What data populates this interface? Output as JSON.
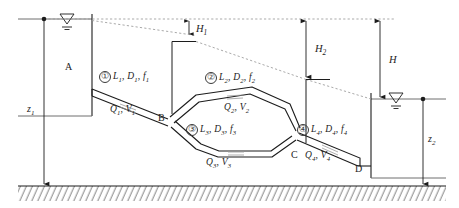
{
  "figure": {
    "type": "engineering-schematic",
    "background_color": "#ffffff",
    "line_color": "#1c1c1c",
    "hgl_color": "#8a8a8a"
  },
  "reservoirs": [
    {
      "id": "A",
      "label": "A",
      "side": "left"
    },
    {
      "id": "D",
      "label": "D",
      "side": "right"
    }
  ],
  "nodes": [
    {
      "id": "B",
      "label": "B"
    },
    {
      "id": "C",
      "label": "C"
    },
    {
      "id": "D",
      "label": "D"
    }
  ],
  "pipes": [
    {
      "number": "①",
      "geometry_label": "L",
      "geometry": {
        "length": "L",
        "diameter": "D",
        "friction": "f",
        "index": "1"
      },
      "flow": {
        "discharge": "Q",
        "velocity": "V",
        "index": "1"
      }
    },
    {
      "number": "②",
      "geometry": {
        "length": "L",
        "diameter": "D",
        "friction": "f",
        "index": "2"
      },
      "flow": {
        "discharge": "Q",
        "velocity": "V",
        "index": "2"
      }
    },
    {
      "number": "③",
      "geometry": {
        "length": "L",
        "diameter": "D",
        "friction": "f",
        "index": "3"
      },
      "flow": {
        "discharge": "Q",
        "velocity": "V",
        "index": "3"
      }
    },
    {
      "number": "④",
      "geometry": {
        "length": "L",
        "diameter": "D",
        "friction": "f",
        "index": "4"
      },
      "flow": {
        "discharge": "Q",
        "velocity": "V",
        "index": "4"
      }
    }
  ],
  "head_labels": [
    {
      "symbol": "H",
      "index": "1",
      "name": "head-loss-h1"
    },
    {
      "symbol": "H",
      "index": "2",
      "name": "head-loss-h2"
    },
    {
      "symbol": "H",
      "index": "",
      "name": "total-head-H"
    }
  ],
  "elevation_labels": [
    {
      "symbol": "z",
      "index": "1",
      "name": "elevation-z1"
    },
    {
      "symbol": "z",
      "index": "2",
      "name": "elevation-z2"
    }
  ],
  "water_surface_symbol": "inverted-triangle-with-hatch",
  "ground_symbol": "hatched-datum"
}
